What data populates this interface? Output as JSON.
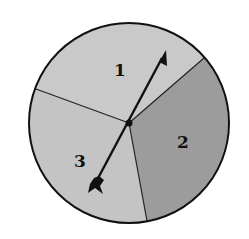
{
  "spinner": {
    "center": [
      129,
      123
    ],
    "radius": 100,
    "sections": [
      {
        "label": "1",
        "color": "#c9c9c9",
        "label_pos": [
          120,
          76
        ]
      },
      {
        "label": "2",
        "color": "#9c9c9c",
        "label_pos": [
          183,
          148
        ]
      },
      {
        "label": "3",
        "color": "#c4c4c4",
        "label_pos": [
          80,
          167
        ]
      }
    ],
    "dividers": [
      {
        "to": [
          204,
          58
        ]
      },
      {
        "to": [
          36,
          89
        ]
      },
      {
        "to": [
          147,
          221
        ]
      }
    ],
    "arrow": {
      "tip": [
        166,
        50
      ],
      "tail": [
        92,
        190
      ],
      "color": "#111111"
    },
    "outline_color": "#111111"
  }
}
